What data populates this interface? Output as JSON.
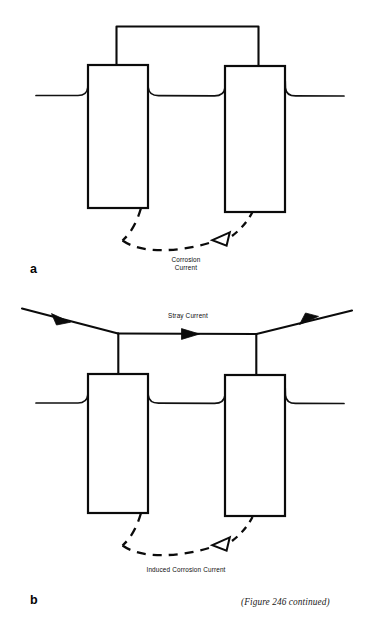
{
  "figure": {
    "caption": "(Figure 246 continued)",
    "panels": [
      {
        "id": "a",
        "letter": "a",
        "description": "Bonded buried structures with corrosion current",
        "labels": [
          {
            "name": "corrosion-current-label",
            "line1": "Corrosion",
            "line2": "Current"
          }
        ],
        "elements": {
          "bond_wire": "top connecting bond wire",
          "ground_line": "soil surface line",
          "left_structure": "buried structure",
          "right_structure": "buried structure",
          "current_path": "dashed corrosion current arc"
        }
      },
      {
        "id": "b",
        "letter": "b",
        "description": "Buried structures under an overhead stray current source",
        "labels": [
          {
            "name": "stray-current-label",
            "line1": "Stray Current",
            "line2": ""
          },
          {
            "name": "induced-corrosion-current-label",
            "line1": "Induced Corrosion Current",
            "line2": ""
          }
        ],
        "elements": {
          "overhead_line": "stray current conductor",
          "ground_line": "soil surface line",
          "left_structure": "buried structure",
          "right_structure": "buried structure",
          "current_path": "dashed induced corrosion current arc"
        }
      }
    ]
  },
  "colors": {
    "ink": "#0b0b0b",
    "background": "#ffffff",
    "caption_ink": "#1a1a1a"
  }
}
